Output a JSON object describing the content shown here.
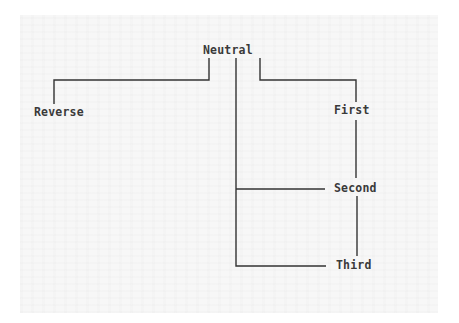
{
  "diagram": {
    "type": "tree",
    "root": {
      "id": "neutral",
      "label": "Neutral"
    },
    "nodes": [
      {
        "id": "reverse",
        "label": "Reverse"
      },
      {
        "id": "first",
        "label": "First"
      },
      {
        "id": "second",
        "label": "Second"
      },
      {
        "id": "third",
        "label": "Third"
      }
    ],
    "edges": [
      {
        "from": "neutral",
        "to": "reverse"
      },
      {
        "from": "neutral",
        "to": "first"
      },
      {
        "from": "neutral",
        "to": "second"
      },
      {
        "from": "neutral",
        "to": "third"
      },
      {
        "from": "first",
        "to": "second"
      },
      {
        "from": "second",
        "to": "third"
      }
    ],
    "line_color": "#333333",
    "text_color": "#3a3a3a"
  }
}
